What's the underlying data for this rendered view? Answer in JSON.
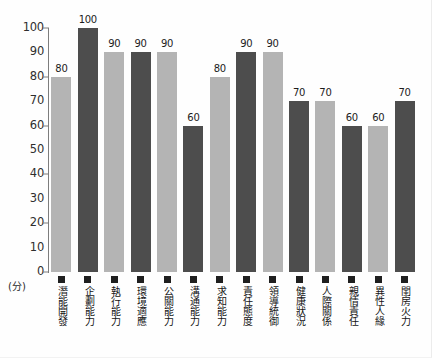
{
  "chart_data": {
    "type": "bar",
    "title": "",
    "xlabel": "",
    "ylabel": "(分)",
    "ylim": [
      0,
      100
    ],
    "ytick_step": 10,
    "yticks": [
      "100",
      "90",
      "80",
      "70",
      "60",
      "50",
      "40",
      "30",
      "20",
      "10",
      "0"
    ],
    "grid": false,
    "legend": "none",
    "categories": [
      "潛能開發",
      "企劃能力",
      "執行能力",
      "環境適應",
      "公關能力",
      "溝通能力",
      "求知能力",
      "責任態度",
      "領導統御",
      "健康狀況",
      "人際關係",
      "親情責任",
      "異性人緣",
      "閨房火力"
    ],
    "values": [
      80,
      100,
      90,
      90,
      90,
      60,
      80,
      90,
      90,
      70,
      70,
      60,
      60,
      70
    ],
    "bar_styles": [
      "light",
      "dark",
      "light",
      "dark",
      "light",
      "dark",
      "light",
      "dark",
      "light",
      "dark",
      "light",
      "dark",
      "light",
      "dark"
    ],
    "colors": {
      "light_bar": "#b4b4b4",
      "dark_bar": "#4d4d4d",
      "axis": "#7d7d7d",
      "text": "#1c1c1c",
      "background": "#fefefe"
    }
  }
}
